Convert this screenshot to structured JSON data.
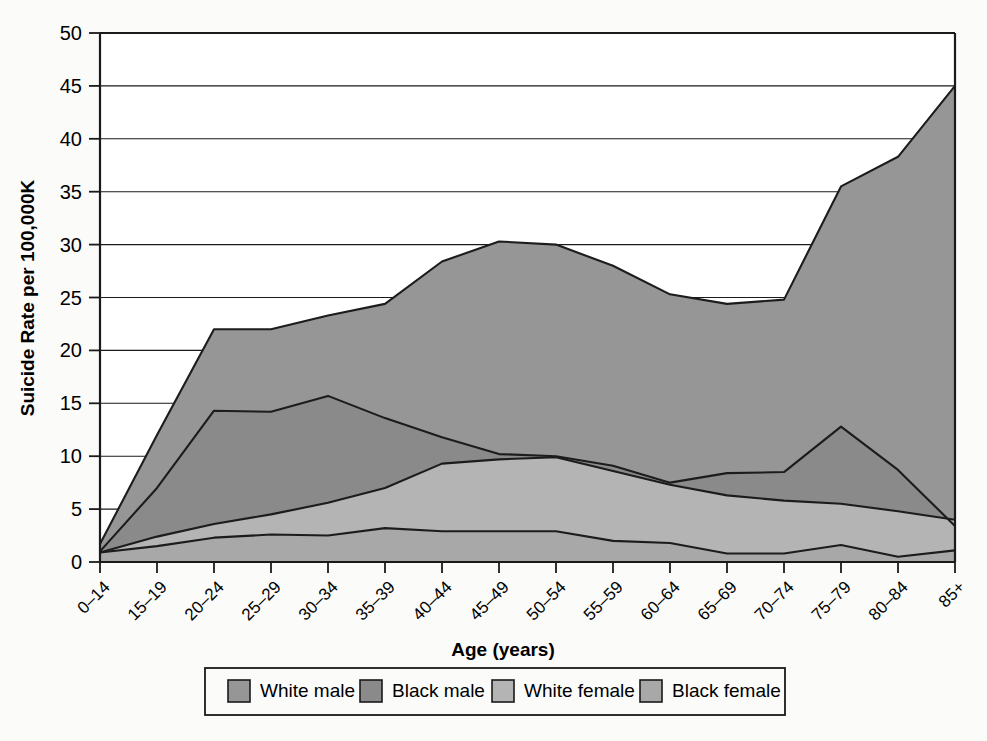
{
  "chart_data": {
    "type": "area",
    "title": "",
    "xlabel": "Age (years)",
    "ylabel": "Suicide Rate per 100,000K",
    "ylim": [
      0,
      50
    ],
    "ytick_step": 5,
    "grid": true,
    "stacked": false,
    "legend_position": "bottom",
    "categories": [
      "0–14",
      "15–19",
      "20–24",
      "25–29",
      "30–34",
      "35–39",
      "40–44",
      "45–49",
      "50–54",
      "55–59",
      "60–64",
      "65–69",
      "70–74",
      "75–79",
      "80–84",
      "85+"
    ],
    "ytick_labels": [
      "0",
      "5",
      "10",
      "15",
      "20",
      "25",
      "30",
      "35",
      "40",
      "45",
      "50"
    ],
    "series": [
      {
        "name": "White male",
        "color": "#969696",
        "values": [
          1.7,
          12.0,
          22.0,
          22.0,
          23.3,
          24.4,
          28.4,
          30.3,
          30.0,
          28.0,
          25.3,
          24.4,
          24.8,
          35.5,
          38.3,
          45.0
        ]
      },
      {
        "name": "Black male",
        "color": "#8a8a8a",
        "values": [
          1.0,
          7.0,
          14.3,
          14.2,
          15.7,
          13.6,
          11.8,
          10.2,
          10.0,
          9.1,
          7.5,
          8.4,
          8.5,
          12.8,
          8.7,
          3.4
        ]
      },
      {
        "name": "White female",
        "color": "#b4b4b4",
        "values": [
          0.9,
          2.4,
          3.6,
          4.5,
          5.6,
          7.0,
          9.3,
          9.7,
          9.9,
          8.6,
          7.3,
          6.3,
          5.8,
          5.5,
          4.8,
          4.0
        ]
      },
      {
        "name": "Black female",
        "color": "#a8a8a8",
        "values": [
          0.9,
          1.5,
          2.3,
          2.6,
          2.5,
          3.2,
          2.9,
          2.9,
          2.9,
          2.0,
          1.8,
          0.8,
          0.8,
          1.6,
          0.5,
          1.1
        ]
      }
    ]
  },
  "legend": {
    "entries": [
      {
        "label": "White male",
        "color": "#969696"
      },
      {
        "label": "Black male",
        "color": "#8a8a8a"
      },
      {
        "label": "White female",
        "color": "#b4b4b4"
      },
      {
        "label": "Black female",
        "color": "#a8a8a8"
      }
    ]
  },
  "colors": {
    "white_male": "#969696",
    "black_male": "#8a8a8a",
    "white_female": "#b4b4b4",
    "black_female": "#a8a8a8",
    "axis": "#1a1a1a",
    "background": "#fbfbf9"
  }
}
